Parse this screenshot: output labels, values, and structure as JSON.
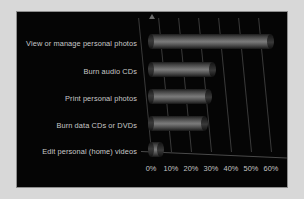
{
  "frame": {
    "background_color": "#d8d8d8",
    "panel_color": "#050505",
    "border_color": "#8e8e8e"
  },
  "style": {
    "text_color": "#c9c9c9",
    "grid_color": "#3a3a3a",
    "bar_color": "#6e6e6e"
  },
  "chart_data": {
    "type": "bar",
    "orientation": "horizontal",
    "title": "",
    "xlabel": "",
    "ylabel": "",
    "categories": [
      "View or manage personal photos",
      "Burn audio CDs",
      "Print personal photos",
      "Burn data CDs or DVDs",
      "Edit personal (home) videos"
    ],
    "values": [
      60,
      31,
      29,
      27,
      5
    ],
    "value_unit": "%",
    "xlim": [
      0,
      65
    ],
    "xticks": [
      0,
      10,
      20,
      30,
      40,
      50,
      60
    ],
    "xtick_labels": [
      "0%",
      "10%",
      "20%",
      "30%",
      "40%",
      "50%",
      "60%"
    ],
    "grid": true,
    "legend": null,
    "style_3d": true
  }
}
